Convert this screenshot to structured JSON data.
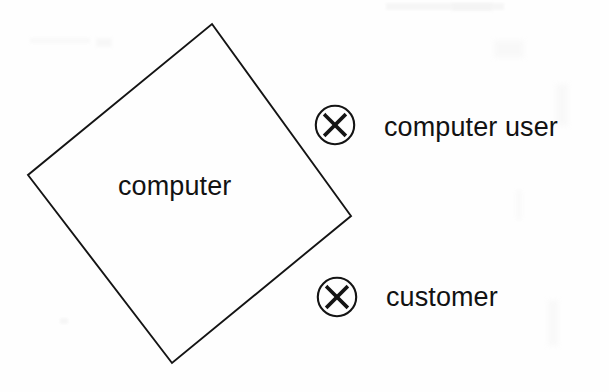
{
  "diagram": {
    "type": "entity-relationship-actor-diagram",
    "background_color": "#fefefe",
    "stroke_color": "#121212",
    "nodes": [
      {
        "id": "computer",
        "shape": "diamond",
        "label": "computer",
        "filled": false,
        "vertices": [
          [
            212,
            24
          ],
          [
            351,
            216
          ],
          [
            172,
            363
          ],
          [
            28,
            175
          ]
        ]
      }
    ],
    "actors": [
      {
        "id": "computer-user",
        "marker": "x-in-circle",
        "label": "computer user"
      },
      {
        "id": "customer",
        "marker": "x-in-circle",
        "label": "customer"
      }
    ]
  }
}
